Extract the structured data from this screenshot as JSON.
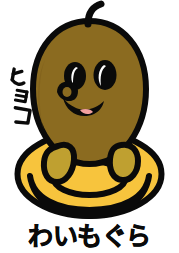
{
  "illustration": {
    "name": "waimogura-mascot",
    "background_color": "#FFFFFF",
    "outline_color": "#0A0A0A",
    "caption": "わいもぐら",
    "side_label": "ヒョコ",
    "side_label_characters": [
      "ヒ",
      "ョ",
      "コ"
    ],
    "side_label_orientation": "vertical",
    "caption_position": "bottom-center",
    "side_label_position": "left-middle"
  },
  "palette": {
    "body_brown": "#8B6B20",
    "body_brown_dark": "#7A5C1A",
    "ring_yellow": "#F7C43D",
    "ring_yellow_shadow": "#E8B32C",
    "paw_olive": "#BFA030",
    "eye_black": "#0A0A0A",
    "eye_highlight": "#FFFFFF",
    "tongue_pink": "#F2A0A0",
    "outline": "#0A0A0A",
    "background": "#FFFFFF"
  },
  "parts": {
    "sprout": "sprout-stem",
    "head_body": "mole-body",
    "eye_left": "left-eye",
    "eye_right": "right-eye",
    "snout": "snout-nose",
    "mouth": "smiling-mouth",
    "tongue": "tongue",
    "paw_left": "left-paw",
    "paw_right": "right-paw",
    "swim_ring": "swim-ring-float"
  },
  "labels": {
    "art_alt": "わいもぐら",
    "side_label_alt": "ヒョコ"
  }
}
